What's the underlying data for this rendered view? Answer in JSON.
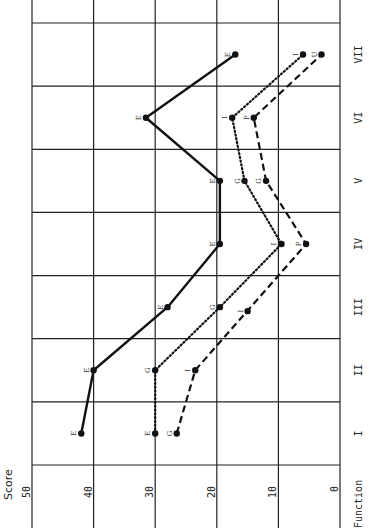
{
  "chart_data": {
    "type": "line",
    "orientation": "rotated-90-ccw",
    "title": "",
    "xlabel": "Function",
    "ylabel": "Score",
    "categories": [
      "I",
      "II",
      "III",
      "IV",
      "V",
      "VI",
      "VII"
    ],
    "ylim": [
      0,
      50
    ],
    "yticks": [
      0,
      10,
      20,
      30,
      40,
      50
    ],
    "grid": true,
    "legend": null,
    "series": [
      {
        "name": "solid",
        "style": "solid",
        "values": [
          42,
          40,
          28,
          19.5,
          19.5,
          31.5,
          17
        ],
        "point_labels": [
          "E",
          "E",
          "E",
          "E",
          "E",
          "E",
          "E"
        ]
      },
      {
        "name": "dotted",
        "style": "dotted",
        "values": [
          30,
          30,
          19.5,
          9.5,
          15.5,
          17.5,
          6
        ],
        "point_labels": [
          "E",
          "G",
          "G",
          "I",
          "G",
          "I",
          "I"
        ]
      },
      {
        "name": "dashed",
        "style": "dashed",
        "values": [
          26.5,
          23.5,
          null,
          5.5,
          12,
          14,
          3
        ],
        "point_labels": [
          "G",
          "I",
          "",
          "P",
          "G",
          "P",
          "U"
        ]
      }
    ],
    "isolated_points": [
      {
        "category": "III",
        "value": 15,
        "label": "I"
      }
    ]
  },
  "axis": {
    "score_title": "Score",
    "function_title": "Function",
    "score_ticks": [
      "50",
      "40",
      "30",
      "20",
      "10",
      "0"
    ],
    "function_ticks": [
      "I",
      "II",
      "III",
      "IV",
      "V",
      "VI",
      "VII"
    ]
  }
}
